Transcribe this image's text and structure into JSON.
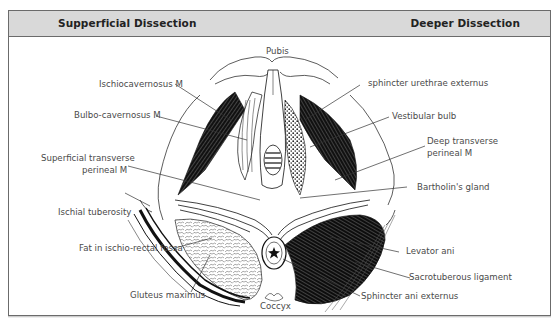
{
  "header": {
    "left_title": "Supperficial Dissection",
    "right_title": "Deeper Dissection"
  },
  "labels": {
    "pubis": "Pubis",
    "coccyx": "Coccyx",
    "left": [
      {
        "id": "ischiocavernosus",
        "text": "Ischiocavernosus M"
      },
      {
        "id": "bulbo_cavernosus",
        "text": "Bulbo-cavernosus M"
      },
      {
        "id": "superficial_transverse_1",
        "text": "Superficial transverse"
      },
      {
        "id": "superficial_transverse_2",
        "text": "perineal M"
      },
      {
        "id": "ischial_tuberosity",
        "text": "Ischial tuberosity"
      },
      {
        "id": "fat_ischio_rectal",
        "text": "Fat in ischio-rectal fossa"
      },
      {
        "id": "gluteus_maximus",
        "text": "Gluteus maximus"
      }
    ],
    "right": [
      {
        "id": "sphincter_urethrae",
        "text": "sphincter urethrae externus"
      },
      {
        "id": "vestibular_bulb",
        "text": "Vestibular bulb"
      },
      {
        "id": "deep_transverse_1",
        "text": "Deep transverse"
      },
      {
        "id": "deep_transverse_2",
        "text": "perineal M"
      },
      {
        "id": "bartholins_gland",
        "text": "Bartholin's gland"
      },
      {
        "id": "levator_ani",
        "text": "Levator ani"
      },
      {
        "id": "sacrotuberous",
        "text": "Sacrotuberous ligament"
      },
      {
        "id": "sphincter_ani",
        "text": "Sphincter ani externus"
      }
    ]
  },
  "colors": {
    "header_bg": "#d9d9d9",
    "border": "#6b6b6b",
    "label_text": "#4a4a4a",
    "ink": "#111111"
  }
}
